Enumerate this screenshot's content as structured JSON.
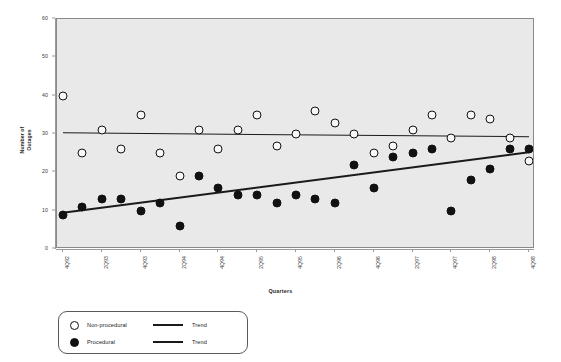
{
  "chart_data": {
    "type": "scatter",
    "title": "",
    "xlabel": "Quarters",
    "ylabel": "Number of Outages",
    "ylim": [
      0,
      60
    ],
    "yticks": [
      0,
      10,
      20,
      30,
      40,
      50,
      60
    ],
    "grid": false,
    "legend_position": "below-left",
    "plot_background": "#e9e9e9",
    "marker_color": "#111111",
    "x": [
      "4Q92",
      "1Q93",
      "2Q93",
      "3Q93",
      "4Q93",
      "1Q94",
      "2Q94",
      "3Q94",
      "4Q94",
      "1Q95",
      "2Q95",
      "3Q95",
      "4Q95",
      "1Q96",
      "2Q96",
      "3Q96",
      "4Q96",
      "1Q97",
      "2Q97",
      "3Q97",
      "4Q97",
      "1Q98",
      "2Q98",
      "3Q98",
      "4Q98"
    ],
    "xtick_labels": [
      "4Q92",
      "2Q93",
      "4Q93",
      "2Q94",
      "4Q94",
      "2Q95",
      "4Q95",
      "2Q96",
      "4Q96",
      "2Q97",
      "4Q97",
      "2Q98",
      "4Q98"
    ],
    "series": [
      {
        "name": "Non-procedural",
        "marker": "open-circle",
        "values": [
          40,
          25,
          31,
          26,
          35,
          25,
          19,
          31,
          26,
          31,
          35,
          27,
          30,
          36,
          33,
          30,
          25,
          27,
          31,
          35,
          29,
          35,
          34,
          29,
          23
        ]
      },
      {
        "name": "Procedural",
        "marker": "filled-circle",
        "values": [
          9,
          11,
          13,
          13,
          10,
          12,
          6,
          19,
          16,
          14,
          14,
          12,
          14,
          13,
          12,
          22,
          16,
          24,
          25,
          26,
          10,
          18,
          21,
          26,
          26
        ]
      }
    ],
    "trends": [
      {
        "name": "Trend",
        "of_series": "Non-procedural",
        "style": "thin",
        "start_value": 30.2,
        "end_value": 29.2
      },
      {
        "name": "Trend",
        "of_series": "Procedural",
        "style": "thick",
        "start_value": 9.4,
        "end_value": 25.2
      }
    ]
  },
  "axes": {
    "y_title": "Number of\nOutages",
    "y_title_line1": "Number of",
    "y_title_line2": "Outages",
    "x_title": "Quarters"
  },
  "legend": {
    "rows": [
      {
        "marker": "open-circle",
        "label": "Non-procedural",
        "trend_label": "Trend",
        "line_style": "thin"
      },
      {
        "marker": "filled-circle",
        "label": "Procedural",
        "trend_label": "Trend",
        "line_style": "thick"
      }
    ]
  }
}
